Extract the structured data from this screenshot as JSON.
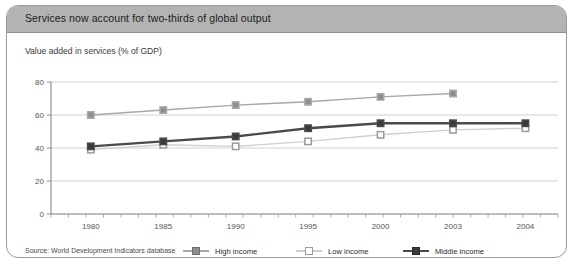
{
  "panel": {
    "title": "Services now account for two-thirds of global output",
    "title_bar_color": "#b3b3b3",
    "border_color": "#9a9a9a",
    "background": "#ffffff"
  },
  "source_note": "Source: World Development Indicators database",
  "chart_data": {
    "type": "line",
    "title": "Value added in services (% of GDP)",
    "subtitle": "Value added in services (% of GDP)",
    "xlabel": "",
    "ylabel": "",
    "categories": [
      "1980",
      "1985",
      "1990",
      "1995",
      "2000",
      "2003",
      "2004"
    ],
    "ylim": [
      0,
      80
    ],
    "yticks": [
      0,
      20,
      40,
      60,
      80
    ],
    "ytick_labels": [
      "0",
      "20",
      "40",
      "60",
      "80"
    ],
    "grid": true,
    "grid_axis": "y",
    "legend_position": "bottom",
    "series": [
      {
        "name": "High income",
        "color": "#a8a8a8",
        "marker": "filled-square",
        "marker_color": "#8d8d8d",
        "line_width": 1.4,
        "values": [
          60,
          63,
          66,
          68,
          71,
          73,
          null
        ]
      },
      {
        "name": "Low income",
        "color": "#cfcfcf",
        "marker": "open-square",
        "marker_color": "#ffffff",
        "line_width": 1.4,
        "values": [
          39,
          42,
          41,
          44,
          48,
          51,
          52
        ]
      },
      {
        "name": "Middle income",
        "color": "#4a4a4a",
        "marker": "filled-square",
        "marker_color": "#3a3a3a",
        "line_width": 2.4,
        "values": [
          41,
          44,
          47,
          52,
          55,
          55,
          55
        ]
      }
    ]
  }
}
